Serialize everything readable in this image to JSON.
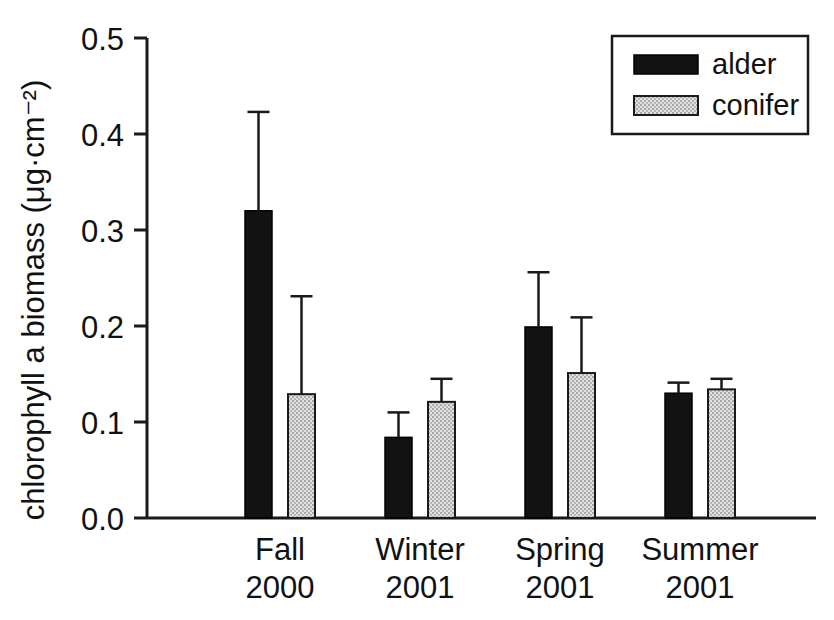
{
  "chart_data": {
    "type": "bar",
    "title": "",
    "xlabel": "",
    "ylabel": "chlorophyll a biomass (μg·cm⁻²)",
    "categories": [
      "Fall 2000",
      "Winter 2001",
      "Spring 2001",
      "Summer 2001"
    ],
    "category_lines": [
      [
        "Fall",
        "2000"
      ],
      [
        "Winter",
        "2001"
      ],
      [
        "Spring",
        "2001"
      ],
      [
        "Summer",
        "2001"
      ]
    ],
    "ylim": [
      0.0,
      0.5
    ],
    "yticks": [
      0.0,
      0.1,
      0.2,
      0.3,
      0.4,
      0.5
    ],
    "ytick_labels": [
      "0.0",
      "0.1",
      "0.2",
      "0.3",
      "0.4",
      "0.5"
    ],
    "grid": false,
    "legend_position": "top-right",
    "error_bars": "upper-only",
    "series": [
      {
        "name": "alder",
        "color": "#121212",
        "fill": "solid-black",
        "values": [
          0.32,
          0.084,
          0.199,
          0.13
        ],
        "errors_upper": [
          0.423,
          0.11,
          0.256,
          0.141
        ]
      },
      {
        "name": "conifer",
        "color": "#c8c8c8",
        "fill": "stippled-gray",
        "values": [
          0.129,
          0.121,
          0.151,
          0.134
        ],
        "errors_upper": [
          0.231,
          0.145,
          0.209,
          0.145
        ]
      }
    ]
  },
  "legend": {
    "items": [
      {
        "label": "alder",
        "swatch": "black-fill-swatch"
      },
      {
        "label": "conifer",
        "swatch": "gray-stipple-swatch"
      }
    ]
  },
  "axes": {
    "y_title": "chlorophyll a biomass (μg·cm⁻²)",
    "y_tick_labels": [
      "0.5",
      "0.4",
      "0.3",
      "0.2",
      "0.1",
      "0.0"
    ]
  }
}
